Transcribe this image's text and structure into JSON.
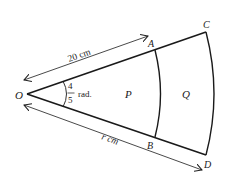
{
  "diagram": {
    "type": "sector-geometry",
    "colors": {
      "stroke": "#1a1a1a",
      "background": "#ffffff"
    },
    "points": {
      "O": {
        "label": "O"
      },
      "A": {
        "label": "A"
      },
      "B": {
        "label": "B"
      },
      "C": {
        "label": "C"
      },
      "D": {
        "label": "D"
      }
    },
    "regions": {
      "P": {
        "label": "P"
      },
      "Q": {
        "label": "Q"
      }
    },
    "angle": {
      "numerator": "4",
      "denominator": "5",
      "unit": "rad."
    },
    "dimensions": {
      "OA": {
        "label": "20 cm"
      },
      "OD": {
        "label": "r cm"
      }
    }
  }
}
